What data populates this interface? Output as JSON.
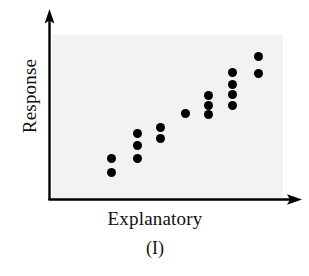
{
  "figure": {
    "caption": "(I)",
    "background_color": "#ffffff",
    "panel_color": "#f2f2f0",
    "axis_color": "#000000",
    "point_color": "#000000"
  },
  "chart_data": {
    "type": "scatter",
    "title": "",
    "subtitle": "",
    "caption": "(I)",
    "xlabel": "Explanatory",
    "ylabel": "Response",
    "xticklabels": [],
    "yticklabels": [],
    "grid": false,
    "legend": null,
    "axis_style": "arrow-axes (L-shaped, arrowheads at both ends)",
    "relationship": "positive linear association, moderately strong",
    "xlim": [
      0,
      10
    ],
    "ylim": [
      0,
      10
    ],
    "n_points": 18,
    "points": [
      {
        "x": 2.55,
        "y": 2.45
      },
      {
        "x": 2.55,
        "y": 1.6
      },
      {
        "x": 3.65,
        "y": 4.0
      },
      {
        "x": 3.65,
        "y": 3.3
      },
      {
        "x": 3.65,
        "y": 2.45
      },
      {
        "x": 4.65,
        "y": 4.35
      },
      {
        "x": 4.65,
        "y": 3.7
      },
      {
        "x": 5.75,
        "y": 5.25
      },
      {
        "x": 6.75,
        "y": 6.35
      },
      {
        "x": 6.75,
        "y": 5.75
      },
      {
        "x": 6.75,
        "y": 5.25
      },
      {
        "x": 7.75,
        "y": 7.8
      },
      {
        "x": 7.75,
        "y": 7.05
      },
      {
        "x": 7.75,
        "y": 6.45
      },
      {
        "x": 7.75,
        "y": 5.75
      },
      {
        "x": 8.85,
        "y": 8.85
      },
      {
        "x": 8.85,
        "y": 7.8
      }
    ],
    "points_pixel": [
      {
        "cx": 111,
        "cy": 158
      },
      {
        "cx": 111,
        "cy": 172
      },
      {
        "cx": 137,
        "cy": 133
      },
      {
        "cx": 137,
        "cy": 145
      },
      {
        "cx": 137,
        "cy": 158
      },
      {
        "cx": 160,
        "cy": 127
      },
      {
        "cx": 160,
        "cy": 138
      },
      {
        "cx": 185,
        "cy": 113
      },
      {
        "cx": 208,
        "cy": 95
      },
      {
        "cx": 208,
        "cy": 105
      },
      {
        "cx": 208,
        "cy": 114
      },
      {
        "cx": 232,
        "cy": 72
      },
      {
        "cx": 232,
        "cy": 84
      },
      {
        "cx": 232,
        "cy": 94
      },
      {
        "cx": 232,
        "cy": 105
      },
      {
        "cx": 258,
        "cy": 56
      },
      {
        "cx": 258,
        "cy": 73
      }
    ],
    "point_diameter_px": 9
  }
}
